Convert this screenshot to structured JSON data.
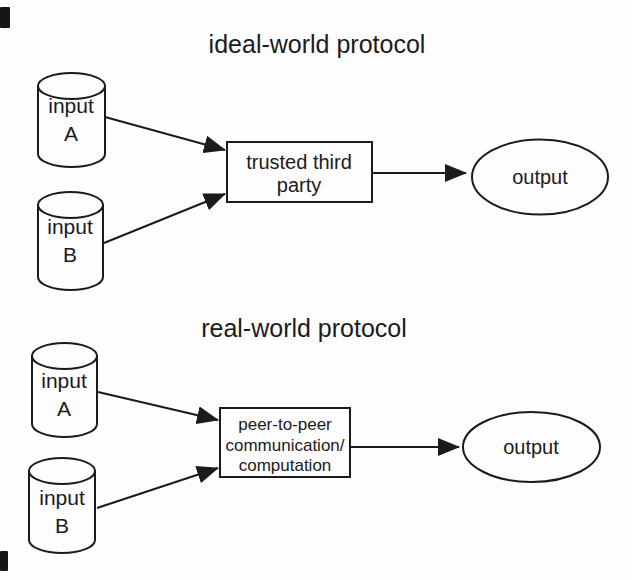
{
  "figure": {
    "ideal": {
      "title": "ideal-world protocol",
      "input_a_line1": "input",
      "input_a_line2": "A",
      "input_b_line1": "input",
      "input_b_line2": "B",
      "box_line1": "trusted third",
      "box_line2": "party",
      "output_label": "output"
    },
    "real": {
      "title": "real-world protocol",
      "input_a_line1": "input",
      "input_a_line2": "A",
      "input_b_line1": "input",
      "input_b_line2": "B",
      "box_line1": "peer-to-peer",
      "box_line2": "communication/",
      "box_line3": "computation",
      "output_label": "output"
    },
    "colors": {
      "stroke": "#1b1b1b",
      "background": "#fdfdfd"
    }
  }
}
